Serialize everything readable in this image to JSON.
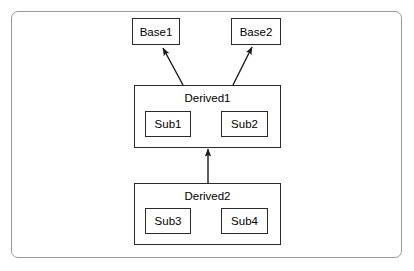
{
  "diagram": {
    "type": "class-inheritance-diagram",
    "background_color": "#ffffff",
    "frame_border_color": "#9a9a9a",
    "node_border_color": "#2b2b2b",
    "text_color": "#000000",
    "base_classes": [
      {
        "id": "base1",
        "label": "Base1",
        "x": 132,
        "y": 18,
        "w": 48,
        "h": 27
      },
      {
        "id": "base2",
        "label": "Base2",
        "x": 231,
        "y": 18,
        "w": 50,
        "h": 27
      }
    ],
    "derived_classes": [
      {
        "id": "derived1",
        "label": "Derived1",
        "x": 134,
        "y": 85,
        "w": 147,
        "h": 63,
        "members": [
          {
            "id": "sub1",
            "label": "Sub1",
            "x": 145,
            "y": 111,
            "w": 46,
            "h": 26
          },
          {
            "id": "sub2",
            "label": "Sub2",
            "x": 221,
            "y": 111,
            "w": 47,
            "h": 26
          }
        ]
      },
      {
        "id": "derived2",
        "label": "Derived2",
        "x": 134,
        "y": 183,
        "w": 147,
        "h": 62,
        "members": [
          {
            "id": "sub3",
            "label": "Sub3",
            "x": 145,
            "y": 208,
            "w": 46,
            "h": 26
          },
          {
            "id": "sub4",
            "label": "Sub4",
            "x": 221,
            "y": 208,
            "w": 47,
            "h": 26
          }
        ]
      }
    ],
    "relationships": [
      {
        "id": "derived1-to-base1",
        "from": "derived1",
        "to": "base1",
        "kind": "inherits",
        "x1": 183,
        "y1": 85,
        "x2": 163,
        "y2": 48
      },
      {
        "id": "derived1-to-base2",
        "from": "derived1",
        "to": "base2",
        "kind": "inherits",
        "x1": 233,
        "y1": 85,
        "x2": 252,
        "y2": 47
      },
      {
        "id": "derived2-to-derived1",
        "from": "derived2",
        "to": "derived1",
        "kind": "inherits",
        "x1": 208,
        "y1": 183,
        "x2": 208,
        "y2": 149
      }
    ]
  }
}
